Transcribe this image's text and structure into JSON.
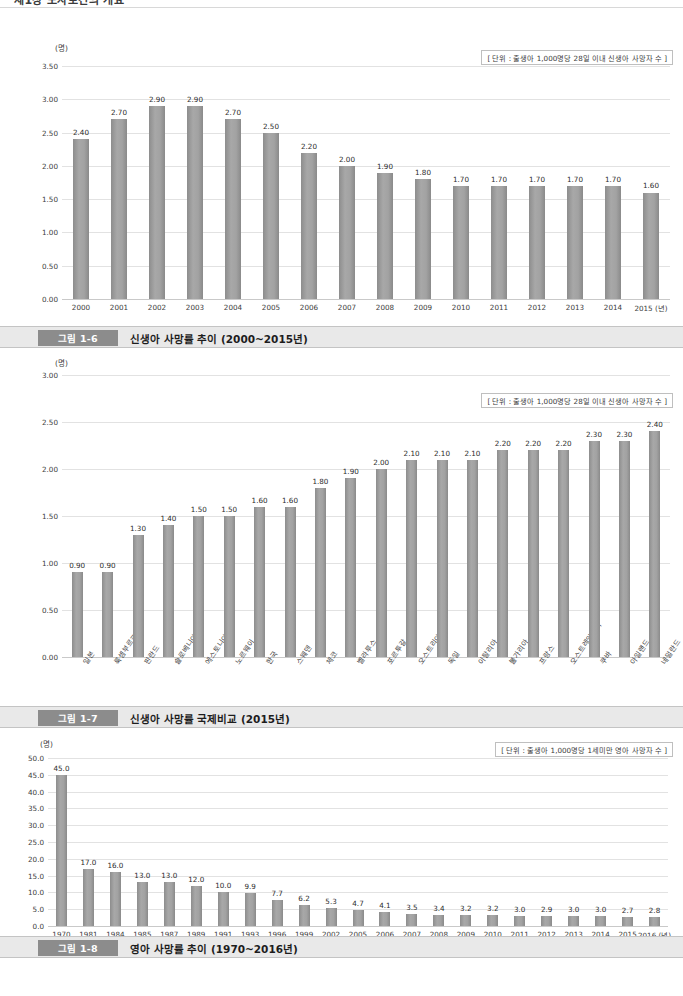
{
  "page": {
    "running_head": "제1장 모자보건의 개요",
    "width": 683,
    "height": 996,
    "bar_color": "#9a9a9a",
    "caption_tag_color": "#8c8c8c",
    "caption_bg_color": "#e9e9e9"
  },
  "figures": [
    {
      "tag": "그림 1-6",
      "title": "신생아 사망률 추이 (2000~2015년)",
      "axis_unit": "(명)",
      "unit_note": "[ 단위 : 출생아 1,000명당 28일 이내 신생아 사망자 수 ]",
      "chart_data": {
        "type": "bar",
        "title": "신생아 사망률 추이 (2000~2015년)",
        "xlabel": "(년)",
        "ylabel": "(명)",
        "ylim": [
          0,
          3.5
        ],
        "yticks": [
          "0.00",
          "0.50",
          "1.00",
          "1.50",
          "2.00",
          "2.50",
          "3.00",
          "3.50"
        ],
        "ytick_values": [
          0,
          0.5,
          1.0,
          1.5,
          2.0,
          2.5,
          3.0,
          3.5
        ],
        "grid": true,
        "legend": "none",
        "categories": [
          "2000",
          "2001",
          "2002",
          "2003",
          "2004",
          "2005",
          "2006",
          "2007",
          "2008",
          "2009",
          "2010",
          "2011",
          "2012",
          "2013",
          "2014",
          "2015"
        ],
        "values": [
          2.4,
          2.7,
          2.9,
          2.9,
          2.7,
          2.5,
          2.2,
          2.0,
          1.9,
          1.8,
          1.7,
          1.7,
          1.7,
          1.7,
          1.7,
          1.6
        ],
        "value_labels": [
          "2.40",
          "2.70",
          "2.90",
          "2.90",
          "2.70",
          "2.50",
          "2.20",
          "2.00",
          "1.90",
          "1.80",
          "1.70",
          "1.70",
          "1.70",
          "1.70",
          "1.70",
          "1.60"
        ]
      }
    },
    {
      "tag": "그림 1-7",
      "title": "신생아 사망률 국제비교 (2015년)",
      "axis_unit": "(명)",
      "unit_note": "[ 단위 : 출생아 1,000명당 28일 이내 신생아 사망자 수 ]",
      "chart_data": {
        "type": "bar",
        "title": "신생아 사망률 국제비교 (2015년)",
        "xlabel": "",
        "ylabel": "(명)",
        "ylim": [
          0,
          3.0
        ],
        "yticks": [
          "0.00",
          "0.50",
          "1.00",
          "1.50",
          "2.00",
          "2.50",
          "3.00"
        ],
        "ytick_values": [
          0,
          0.5,
          1.0,
          1.5,
          2.0,
          2.5,
          3.0
        ],
        "grid": true,
        "legend": "none",
        "categories": [
          "일본",
          "룩셈부르크",
          "핀란드",
          "슬로베니아",
          "에스토니아",
          "노르웨이",
          "한국",
          "스웨덴",
          "체코",
          "벨라루스",
          "포르투갈",
          "오스트리아",
          "독일",
          "이탈리아",
          "불가리아",
          "프랑스",
          "오스트레일리아",
          "쿠바",
          "아일랜드",
          "네덜란드"
        ],
        "values": [
          0.9,
          0.9,
          1.3,
          1.4,
          1.5,
          1.5,
          1.6,
          1.6,
          1.8,
          1.9,
          2.0,
          2.1,
          2.1,
          2.1,
          2.2,
          2.2,
          2.2,
          2.3,
          2.3,
          2.4
        ],
        "value_labels": [
          "0.90",
          "0.90",
          "1.30",
          "1.40",
          "1.50",
          "1.50",
          "1.60",
          "1.60",
          "1.80",
          "1.90",
          "2.00",
          "2.10",
          "2.10",
          "2.10",
          "2.20",
          "2.20",
          "2.20",
          "2.30",
          "2.30",
          "2.40"
        ]
      }
    },
    {
      "tag": "그림 1-8",
      "title": "영아 사망률 추이 (1970~2016년)",
      "axis_unit": "(명)",
      "unit_note": "[ 단위 : 출생아 1,000명당 1세미만 영아 사망자 수 ]",
      "chart_data": {
        "type": "bar",
        "title": "영아 사망률 추이 (1970~2016년)",
        "xlabel": "(년)",
        "ylabel": "(명)",
        "ylim": [
          0,
          50.0
        ],
        "yticks": [
          "0.0",
          "5.0",
          "10.0",
          "15.0",
          "20.0",
          "25.0",
          "30.0",
          "35.0",
          "40.0",
          "45.0",
          "50.0"
        ],
        "ytick_values": [
          0,
          5,
          10,
          15,
          20,
          25,
          30,
          35,
          40,
          45,
          50
        ],
        "grid": true,
        "legend": "none",
        "categories": [
          "1970",
          "1981",
          "1984",
          "1985",
          "1987",
          "1989",
          "1991",
          "1993",
          "1996",
          "1999",
          "2002",
          "2005",
          "2006",
          "2007",
          "2008",
          "2009",
          "2010",
          "2011",
          "2012",
          "2013",
          "2014",
          "2015",
          "2016"
        ],
        "values": [
          45.0,
          17.0,
          16.0,
          13.0,
          13.0,
          12.0,
          10.0,
          9.9,
          7.7,
          6.2,
          5.3,
          4.7,
          4.1,
          3.5,
          3.4,
          3.2,
          3.2,
          3.0,
          2.9,
          3.0,
          3.0,
          2.7,
          2.8
        ],
        "value_labels": [
          "45.0",
          "17.0",
          "16.0",
          "13.0",
          "13.0",
          "12.0",
          "10.0",
          "9.9",
          "7.7",
          "6.2",
          "5.3",
          "4.7",
          "4.1",
          "3.5",
          "3.4",
          "3.2",
          "3.2",
          "3.0",
          "2.9",
          "3.0",
          "3.0",
          "2.7",
          "2.8"
        ]
      }
    }
  ]
}
